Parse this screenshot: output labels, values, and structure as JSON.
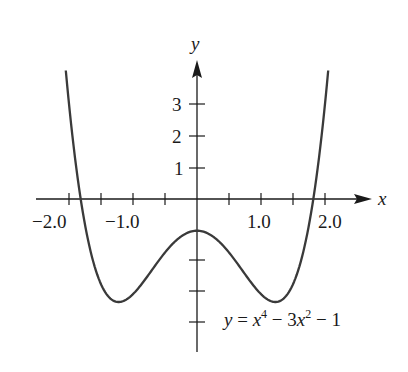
{
  "chart_data": {
    "type": "line",
    "title": "",
    "xlabel": "x",
    "ylabel": "y",
    "annotation": "y = x^4 - 3x^2 - 1",
    "function": "x^4 - 3x^2 - 1",
    "xlim": [
      -2.6,
      2.8
    ],
    "ylim": [
      -4.3,
      4.8
    ],
    "x_ticks": [
      -2.0,
      -1.5,
      -1.0,
      -0.5,
      0.5,
      1.0,
      1.5,
      2.0
    ],
    "x_tick_labels": [
      {
        "value": -2.0,
        "label": "−2.0"
      },
      {
        "value": -1.0,
        "label": "−1.0"
      },
      {
        "value": 1.0,
        "label": "1.0"
      },
      {
        "value": 2.0,
        "label": "2.0"
      }
    ],
    "y_ticks": [
      -4,
      -3,
      -2,
      1,
      2,
      3
    ],
    "y_tick_labels": [
      {
        "value": 1,
        "label": "1"
      },
      {
        "value": 2,
        "label": "2"
      },
      {
        "value": 3,
        "label": "3"
      }
    ],
    "grid": false,
    "legend": null,
    "x": [
      -2.05,
      -2.0,
      -1.9,
      -1.8,
      -1.7,
      -1.6,
      -1.5,
      -1.4,
      -1.3,
      -1.2247,
      -1.1,
      -1.0,
      -0.9,
      -0.8,
      -0.7,
      -0.6,
      -0.5,
      -0.4,
      -0.3,
      -0.2,
      -0.1,
      0.0,
      0.1,
      0.2,
      0.3,
      0.4,
      0.5,
      0.6,
      0.7,
      0.8,
      0.9,
      1.0,
      1.1,
      1.2247,
      1.3,
      1.4,
      1.5,
      1.6,
      1.7,
      1.8,
      1.9,
      2.0,
      2.05
    ],
    "series": [
      {
        "name": "y = x^4 - 3x^2 - 1",
        "values": [
          4.06,
          3.0,
          1.2,
          -0.22,
          -1.32,
          -2.13,
          -2.69,
          -3.04,
          -3.21,
          -3.25,
          -3.17,
          -3.0,
          -2.77,
          -2.51,
          -2.23,
          -1.95,
          -1.69,
          -1.45,
          -1.26,
          -1.12,
          -1.03,
          -1.0,
          -1.03,
          -1.12,
          -1.26,
          -1.45,
          -1.69,
          -1.95,
          -2.23,
          -2.51,
          -2.77,
          -3.0,
          -3.17,
          -3.25,
          -3.21,
          -3.04,
          -2.69,
          -2.13,
          -1.32,
          -0.22,
          1.2,
          3.0,
          4.06
        ]
      }
    ],
    "colors": {
      "curve": "#3a3a3a",
      "axes": "#1a1a1a"
    }
  },
  "labels": {
    "x_axis": "x",
    "y_axis": "y",
    "eq_y": "y",
    "eq_equals": " = ",
    "eq_x1": "x",
    "eq_pow1": "4",
    "eq_minus1": " − 3",
    "eq_x2": "x",
    "eq_pow2": "2",
    "eq_minus2": " − 1",
    "xt_m2": "−2.0",
    "xt_m1": "−1.0",
    "xt_1": "1.0",
    "xt_2": "2.0",
    "yt_1": "1",
    "yt_2": "2",
    "yt_3": "3"
  }
}
